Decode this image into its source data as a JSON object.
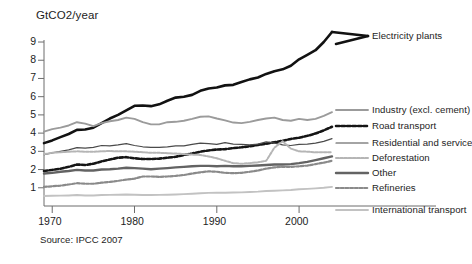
{
  "chart_data": {
    "type": "line",
    "title": "",
    "ylabel": "GtCO2/year",
    "xlabel": "",
    "source": "Source: IPCC 2007",
    "xlim": [
      1969,
      2004
    ],
    "ylim": [
      0,
      9.8
    ],
    "grid": false,
    "legend_position": "right",
    "yticks": [
      1,
      2,
      3,
      4,
      5,
      6,
      7,
      8,
      9
    ],
    "ytick_labels": [
      "1",
      "2",
      "3",
      "4",
      "5",
      "6",
      "7",
      "8",
      "9"
    ],
    "xticks": [
      1970,
      1980,
      1990,
      2000
    ],
    "xtick_labels": [
      "1970",
      "1980",
      "1990",
      "2000"
    ],
    "x": [
      1969,
      1970,
      1971,
      1972,
      1973,
      1974,
      1975,
      1976,
      1977,
      1978,
      1979,
      1980,
      1981,
      1982,
      1983,
      1984,
      1985,
      1986,
      1987,
      1988,
      1989,
      1990,
      1991,
      1992,
      1993,
      1994,
      1995,
      1996,
      1997,
      1998,
      1999,
      2000,
      2001,
      2002,
      2003,
      2004
    ],
    "series": [
      {
        "name": "Electricity plants",
        "color": "#121212",
        "width": 2.6,
        "style": "solid",
        "values": [
          3.45,
          3.6,
          3.78,
          3.95,
          4.18,
          4.2,
          4.3,
          4.55,
          4.8,
          5.0,
          5.25,
          5.5,
          5.52,
          5.48,
          5.58,
          5.78,
          5.95,
          6.0,
          6.1,
          6.32,
          6.45,
          6.5,
          6.62,
          6.65,
          6.8,
          6.95,
          7.05,
          7.25,
          7.4,
          7.5,
          7.7,
          8.05,
          8.3,
          8.55,
          9.0,
          9.55
        ]
      },
      {
        "name": "Industry (excl. cement)",
        "color": "#9b9b9b",
        "width": 1.9,
        "style": "solid",
        "values": [
          4.08,
          4.22,
          4.3,
          4.42,
          4.6,
          4.52,
          4.38,
          4.55,
          4.65,
          4.72,
          4.85,
          4.78,
          4.6,
          4.48,
          4.48,
          4.6,
          4.62,
          4.68,
          4.78,
          4.9,
          4.92,
          4.8,
          4.7,
          4.58,
          4.55,
          4.62,
          4.72,
          4.8,
          4.85,
          4.72,
          4.68,
          4.78,
          4.72,
          4.78,
          4.95,
          5.15
        ]
      },
      {
        "name": "Road transport",
        "color": "#151515",
        "width": 2.6,
        "style": "dashed",
        "values": [
          1.92,
          1.98,
          2.05,
          2.15,
          2.28,
          2.25,
          2.32,
          2.45,
          2.55,
          2.65,
          2.68,
          2.62,
          2.58,
          2.58,
          2.6,
          2.65,
          2.7,
          2.8,
          2.88,
          2.98,
          3.05,
          3.1,
          3.12,
          3.18,
          3.22,
          3.28,
          3.35,
          3.42,
          3.5,
          3.58,
          3.68,
          3.75,
          3.85,
          3.98,
          4.15,
          4.35
        ]
      },
      {
        "name": "Residential and service",
        "color": "#4a4a4a",
        "width": 1.2,
        "style": "solid",
        "values": [
          2.82,
          2.92,
          3.0,
          3.08,
          3.2,
          3.18,
          3.22,
          3.32,
          3.3,
          3.35,
          3.42,
          3.32,
          3.25,
          3.22,
          3.22,
          3.25,
          3.3,
          3.3,
          3.38,
          3.45,
          3.42,
          3.38,
          3.48,
          3.4,
          3.38,
          3.35,
          3.4,
          3.52,
          3.45,
          3.35,
          3.32,
          3.38,
          3.4,
          3.45,
          3.55,
          3.7
        ]
      },
      {
        "name": "Deforestation",
        "color": "#b5b5b5",
        "width": 2.0,
        "style": "dashed",
        "values": [
          2.85,
          2.92,
          2.95,
          2.98,
          3.0,
          2.98,
          2.98,
          3.0,
          3.02,
          3.0,
          3.0,
          2.98,
          2.95,
          2.92,
          2.92,
          2.9,
          2.88,
          2.85,
          2.82,
          2.8,
          2.72,
          2.62,
          2.48,
          2.35,
          2.32,
          2.35,
          2.4,
          2.48,
          3.2,
          3.55,
          3.15,
          3.0,
          2.98,
          2.95,
          2.95,
          2.95
        ]
      },
      {
        "name": "Other",
        "color": "#636363",
        "width": 2.4,
        "style": "solid",
        "values": [
          1.78,
          1.82,
          1.88,
          1.92,
          1.98,
          1.95,
          1.95,
          2.0,
          2.02,
          2.05,
          2.1,
          2.08,
          2.05,
          2.02,
          2.05,
          2.08,
          2.12,
          2.15,
          2.18,
          2.2,
          2.2,
          2.18,
          2.2,
          2.18,
          2.18,
          2.2,
          2.22,
          2.25,
          2.28,
          2.28,
          2.3,
          2.35,
          2.42,
          2.52,
          2.62,
          2.72
        ]
      },
      {
        "name": "Refineries",
        "color": "#8a8a8a",
        "width": 2.2,
        "style": "dashed",
        "values": [
          1.05,
          1.08,
          1.12,
          1.18,
          1.25,
          1.22,
          1.22,
          1.28,
          1.32,
          1.38,
          1.45,
          1.5,
          1.62,
          1.62,
          1.6,
          1.62,
          1.65,
          1.7,
          1.78,
          1.85,
          1.9,
          1.88,
          1.82,
          1.8,
          1.82,
          1.88,
          1.95,
          2.05,
          2.12,
          2.15,
          2.15,
          2.18,
          2.22,
          2.3,
          2.38,
          2.48
        ]
      },
      {
        "name": "International transport",
        "color": "#c2c2c2",
        "width": 1.9,
        "style": "solid",
        "values": [
          0.55,
          0.56,
          0.57,
          0.58,
          0.6,
          0.58,
          0.58,
          0.6,
          0.61,
          0.62,
          0.63,
          0.62,
          0.6,
          0.6,
          0.61,
          0.62,
          0.63,
          0.65,
          0.67,
          0.7,
          0.72,
          0.73,
          0.73,
          0.74,
          0.75,
          0.77,
          0.79,
          0.82,
          0.84,
          0.86,
          0.88,
          0.92,
          0.94,
          0.97,
          1.0,
          1.05
        ]
      }
    ]
  },
  "legend": {
    "entries": [
      {
        "label": "Electricity plants"
      },
      {
        "label": "Industry (excl. cement)"
      },
      {
        "label": "Road transport"
      },
      {
        "label": "Residential and service"
      },
      {
        "label": "Deforestation"
      },
      {
        "label": "Other"
      },
      {
        "label": "Refineries"
      },
      {
        "label": "International transport"
      }
    ]
  }
}
